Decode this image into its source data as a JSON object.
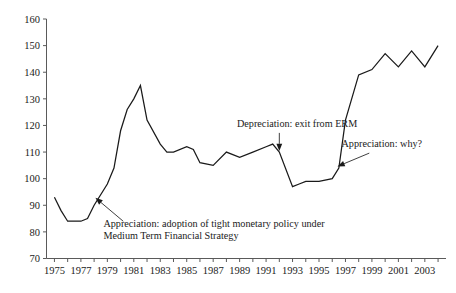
{
  "chart_data": {
    "type": "line",
    "title": "",
    "subtitle": "",
    "xlabel": "",
    "ylabel": "",
    "xlim": [
      1974.4,
      2004.6
    ],
    "ylim": [
      70,
      160
    ],
    "grid": false,
    "legend": "none",
    "y_ticks": [
      70,
      80,
      90,
      100,
      110,
      120,
      130,
      140,
      150,
      160
    ],
    "y_tick_labels": [
      "70",
      "80",
      "90",
      "100",
      "110",
      "120",
      "130",
      "140",
      "150",
      "160"
    ],
    "x_ticks": [
      1975,
      1976,
      1977,
      1978,
      1979,
      1980,
      1981,
      1982,
      1983,
      1984,
      1985,
      1986,
      1987,
      1988,
      1989,
      1990,
      1991,
      1992,
      1993,
      1994,
      1995,
      1996,
      1997,
      1998,
      1999,
      2000,
      2001,
      2002,
      2003,
      2004
    ],
    "x_tick_labels": [
      "1975",
      "",
      "1977",
      "",
      "1979",
      "",
      "1981",
      "",
      "1983",
      "",
      "1985",
      "",
      "1987",
      "",
      "1989",
      "",
      "1991",
      "",
      "1993",
      "",
      "1995",
      "",
      "1997",
      "",
      "1999",
      "",
      "2001",
      "",
      "2003",
      ""
    ],
    "line_color": "#1a1a1a",
    "series": [
      {
        "name": "Sterling effective exchange rate index",
        "x": [
          1975,
          1975.5,
          1976,
          1977,
          1977.5,
          1978,
          1979,
          1979.5,
          1980,
          1980.5,
          1981,
          1981.5,
          1982,
          1983,
          1983.5,
          1984,
          1985,
          1985.5,
          1986,
          1987,
          1988,
          1989,
          1990,
          1991,
          1991.5,
          1992,
          1993,
          1993.5,
          1994,
          1995,
          1996,
          1996.5,
          1997,
          1998,
          1999,
          2000,
          2001,
          2002,
          2003,
          2004
        ],
        "values": [
          93,
          88,
          84,
          84,
          85,
          90,
          98,
          104,
          118,
          126,
          130,
          135,
          122,
          113,
          110,
          110,
          112,
          111,
          106,
          105,
          110,
          108,
          110,
          112,
          113,
          110,
          97,
          98,
          99,
          99,
          100,
          104,
          122,
          139,
          141,
          147,
          142,
          148,
          142,
          150
        ]
      }
    ],
    "annotations": [
      {
        "id": "annotation-tight-monetary-policy",
        "lines": [
          "Appreciation: adoption of tight monetary policy under",
          "Medium Term Financial Strategy"
        ],
        "text_x": 1978.7,
        "text_y": 82.0,
        "arrow_tip_x": 1978.1,
        "arrow_tip_y": 92.8,
        "arrow_tail_x": 1980.2,
        "arrow_tail_y": 84.0,
        "style": "diagonal-arrow"
      },
      {
        "id": "annotation-exit-from-erm",
        "lines": [
          "Depreciation: exit from ERM"
        ],
        "text_x": 1988.8,
        "text_y": 119.5,
        "arrow_tip_x": 1992.0,
        "arrow_tip_y": 110.4,
        "arrow_tail_x": 1992.0,
        "arrow_tail_y": 117.2,
        "style": "vertical-arrow"
      },
      {
        "id": "annotation-appreciation-why",
        "lines": [
          "Appreciation: why?"
        ],
        "text_x": 1996.7,
        "text_y": 112.0,
        "arrow_tip_x": 1996.4,
        "arrow_tip_y": 104.6,
        "arrow_tail_x": 1998.8,
        "arrow_tail_y": 109.6,
        "style": "diagonal-arrow"
      }
    ]
  }
}
